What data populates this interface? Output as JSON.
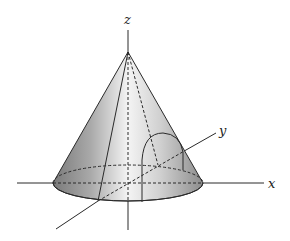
{
  "diagram": {
    "type": "3d-cone-with-axes",
    "axes": {
      "x_label": "x",
      "y_label": "y",
      "z_label": "z"
    },
    "colors": {
      "line": "#2a2a2a",
      "cone_shade_dark": "#8a8a8a",
      "cone_shade_light": "#f2f2f2",
      "background": "#ffffff"
    }
  }
}
